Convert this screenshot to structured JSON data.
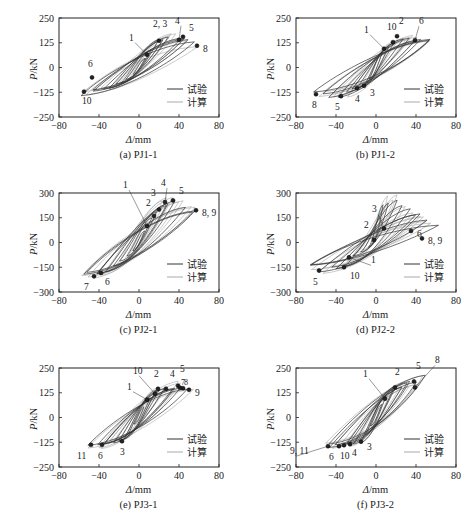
{
  "figure": {
    "x_axis_label": "Δ/mm",
    "y_axis_label": "P/kN",
    "legend": [
      {
        "label": "试验",
        "color": "#333333",
        "role": "test"
      },
      {
        "label": "计算",
        "color": "#aaaaaa",
        "role": "calculation"
      }
    ],
    "colors": {
      "test": "#333333",
      "calc": "#a8a8a8",
      "marker": "#222222",
      "axis": "#222222"
    }
  },
  "chart_data": [
    {
      "type": "line",
      "id": "a",
      "title": "(a) PJ1-1",
      "xlabel": "Δ/mm",
      "ylabel": "P/kN",
      "xlim": [
        -80,
        80
      ],
      "ylim": [
        -250,
        250
      ],
      "xticks": [
        -80,
        -40,
        0,
        40,
        80
      ],
      "yticks": [
        250,
        125,
        0,
        -125,
        -250
      ],
      "legend": [
        "试验",
        "计算"
      ],
      "legend_position": "lower right",
      "grid": false,
      "envelope_pos": [
        [
          0,
          0
        ],
        [
          8,
          65
        ],
        [
          20,
          135
        ],
        [
          33,
          155
        ],
        [
          42,
          150
        ],
        [
          58,
          115
        ]
      ],
      "envelope_neg": [
        [
          0,
          0
        ],
        [
          -10,
          -55
        ],
        [
          -25,
          -95
        ],
        [
          -45,
          -120
        ],
        [
          -55,
          -130
        ]
      ],
      "points": [
        {
          "label": "1",
          "x": 8,
          "y": 65
        },
        {
          "label": "2, 3",
          "x": 20,
          "y": 135
        },
        {
          "label": "4",
          "x": 40,
          "y": 140
        },
        {
          "label": "5",
          "x": 44,
          "y": 155
        },
        {
          "label": "6",
          "x": -47,
          "y": -50
        },
        {
          "label": "8",
          "x": 58,
          "y": 110
        },
        {
          "label": "10",
          "x": -55,
          "y": -122
        }
      ]
    },
    {
      "type": "line",
      "id": "b",
      "title": "(b) PJ1-2",
      "xlabel": "Δ/mm",
      "ylabel": "P/kN",
      "xlim": [
        -80,
        80
      ],
      "ylim": [
        -250,
        250
      ],
      "xticks": [
        -80,
        -40,
        0,
        40,
        80
      ],
      "yticks": [
        250,
        125,
        0,
        -125,
        -250
      ],
      "legend": [
        "试验",
        "计算"
      ],
      "legend_position": "lower right",
      "grid": false,
      "envelope_pos": [
        [
          0,
          0
        ],
        [
          8,
          90
        ],
        [
          18,
          130
        ],
        [
          22,
          160
        ],
        [
          40,
          145
        ],
        [
          58,
          150
        ]
      ],
      "envelope_neg": [
        [
          0,
          0
        ],
        [
          -10,
          -90
        ],
        [
          -18,
          -105
        ],
        [
          -33,
          -145
        ],
        [
          -58,
          -135
        ]
      ],
      "points": [
        {
          "label": "1",
          "x": 8,
          "y": 95
        },
        {
          "label": "10",
          "x": 17,
          "y": 128
        },
        {
          "label": "2",
          "x": 21,
          "y": 158
        },
        {
          "label": "6",
          "x": 39,
          "y": 138
        },
        {
          "label": "3",
          "x": -12,
          "y": -92
        },
        {
          "label": "4",
          "x": -19,
          "y": -105
        },
        {
          "label": "5",
          "x": -35,
          "y": -145
        },
        {
          "label": "8",
          "x": -60,
          "y": -135
        }
      ]
    },
    {
      "type": "line",
      "id": "c",
      "title": "(c) PJ2-1",
      "xlabel": "Δ/mm",
      "ylabel": "P/kN",
      "xlim": [
        -80,
        80
      ],
      "ylim": [
        -300,
        300
      ],
      "xticks": [
        -80,
        -40,
        0,
        40,
        80
      ],
      "yticks": [
        300,
        150,
        0,
        -150,
        -300
      ],
      "legend": [
        "试验",
        "计算"
      ],
      "legend_position": "lower right",
      "grid": false,
      "envelope_pos": [
        [
          0,
          0
        ],
        [
          8,
          100
        ],
        [
          14,
          155
        ],
        [
          18,
          200
        ],
        [
          26,
          245
        ],
        [
          33,
          255
        ],
        [
          56,
          195
        ]
      ],
      "envelope_neg": [
        [
          0,
          0
        ],
        [
          -15,
          -110
        ],
        [
          -30,
          -160
        ],
        [
          -39,
          -185
        ],
        [
          -45,
          -200
        ],
        [
          -58,
          -190
        ]
      ],
      "points": [
        {
          "label": "1",
          "x": 8,
          "y": 100
        },
        {
          "label": "2",
          "x": 15,
          "y": 160
        },
        {
          "label": "3",
          "x": 20,
          "y": 200
        },
        {
          "label": "4",
          "x": 26,
          "y": 245
        },
        {
          "label": "5",
          "x": 34,
          "y": 255
        },
        {
          "label": "8, 9",
          "x": 57,
          "y": 195
        },
        {
          "label": "6",
          "x": -38,
          "y": -185
        },
        {
          "label": "7",
          "x": -45,
          "y": -205
        }
      ]
    },
    {
      "type": "line",
      "id": "d",
      "title": "(d) PJ2-2",
      "xlabel": "Δ/mm",
      "ylabel": "P/kN",
      "xlim": [
        -80,
        80
      ],
      "ylim": [
        -300,
        300
      ],
      "xticks": [
        -80,
        -40,
        0,
        40,
        80
      ],
      "yticks": [
        300,
        150,
        0,
        -150,
        -300
      ],
      "legend": [
        "试验",
        "计算"
      ],
      "legend_position": "lower right",
      "grid": false,
      "envelope_pos": [
        [
          0,
          0
        ],
        [
          -5,
          150
        ],
        [
          8,
          250
        ],
        [
          20,
          270
        ],
        [
          35,
          200
        ],
        [
          58,
          110
        ]
      ],
      "envelope_neg": [
        [
          0,
          0
        ],
        [
          -25,
          -90
        ],
        [
          -31,
          -150
        ],
        [
          -55,
          -170
        ],
        [
          -68,
          -140
        ]
      ],
      "points": [
        {
          "label": "1",
          "x": -27,
          "y": -90
        },
        {
          "label": "2",
          "x": -2,
          "y": 15
        },
        {
          "label": "3",
          "x": 8,
          "y": 85
        },
        {
          "label": "5",
          "x": -57,
          "y": -170
        },
        {
          "label": "6",
          "x": 35,
          "y": 70
        },
        {
          "label": "8, 9",
          "x": 46,
          "y": 25
        },
        {
          "label": "10",
          "x": -32,
          "y": -150
        }
      ]
    },
    {
      "type": "line",
      "id": "e",
      "title": "(e) PJ3-1",
      "xlabel": "Δ/mm",
      "ylabel": "P/kN",
      "xlim": [
        -80,
        80
      ],
      "ylim": [
        -250,
        250
      ],
      "xticks": [
        -80,
        -40,
        0,
        40,
        80
      ],
      "yticks": [
        250,
        125,
        0,
        -125,
        -250
      ],
      "legend": [
        "试验",
        "计算"
      ],
      "legend_position": "lower right",
      "grid": false,
      "envelope_pos": [
        [
          0,
          0
        ],
        [
          8,
          85
        ],
        [
          16,
          125
        ],
        [
          19,
          150
        ],
        [
          27,
          145
        ],
        [
          39,
          165
        ],
        [
          50,
          140
        ]
      ],
      "envelope_neg": [
        [
          0,
          0
        ],
        [
          -17,
          -120
        ],
        [
          -38,
          -140
        ],
        [
          -48,
          -140
        ]
      ],
      "points": [
        {
          "label": "1",
          "x": 8,
          "y": 90
        },
        {
          "label": "10",
          "x": 16,
          "y": 120
        },
        {
          "label": "2",
          "x": 19,
          "y": 145
        },
        {
          "label": "4",
          "x": 27,
          "y": 145
        },
        {
          "label": "5",
          "x": 39,
          "y": 160
        },
        {
          "label": "7",
          "x": 41,
          "y": 150
        },
        {
          "label": "8",
          "x": 44,
          "y": 148
        },
        {
          "label": "9",
          "x": 50,
          "y": 140
        },
        {
          "label": "3",
          "x": -17,
          "y": -120
        },
        {
          "label": "6",
          "x": -37,
          "y": -138
        },
        {
          "label": "11",
          "x": -48,
          "y": -138
        }
      ]
    },
    {
      "type": "line",
      "id": "f",
      "title": "(f) PJ3-2",
      "xlabel": "Δ/mm",
      "ylabel": "P/kN",
      "xlim": [
        -80,
        80
      ],
      "ylim": [
        -250,
        250
      ],
      "xticks": [
        -80,
        -40,
        0,
        40,
        80
      ],
      "yticks": [
        250,
        125,
        0,
        -125,
        -250
      ],
      "legend": [
        "试验",
        "计算"
      ],
      "legend_position": "lower right",
      "grid": false,
      "envelope_pos": [
        [
          0,
          0
        ],
        [
          9,
          95
        ],
        [
          19,
          155
        ],
        [
          38,
          185
        ],
        [
          48,
          200
        ]
      ],
      "envelope_neg": [
        [
          0,
          0
        ],
        [
          -15,
          -120
        ],
        [
          -26,
          -138
        ],
        [
          -33,
          -142
        ],
        [
          -37,
          -145
        ],
        [
          -48,
          -145
        ]
      ],
      "points": [
        {
          "label": "1",
          "x": 9,
          "y": 95
        },
        {
          "label": "2",
          "x": 19,
          "y": 152
        },
        {
          "label": "5",
          "x": 38,
          "y": 182
        },
        {
          "label": "8",
          "x": 39,
          "y": 152
        },
        {
          "label": "3",
          "x": -15,
          "y": -122
        },
        {
          "label": "4",
          "x": -26,
          "y": -135
        },
        {
          "label": "10",
          "x": -32,
          "y": -140
        },
        {
          "label": "6",
          "x": -37,
          "y": -145
        },
        {
          "label": "9, 11",
          "x": -48,
          "y": -145
        }
      ]
    }
  ],
  "layout": {
    "panels": [
      {
        "id": "a",
        "left": 0,
        "top": 0
      },
      {
        "id": "b",
        "left": 237,
        "top": 0
      },
      {
        "id": "c",
        "left": 0,
        "top": 175
      },
      {
        "id": "d",
        "left": 237,
        "top": 175
      },
      {
        "id": "e",
        "left": 0,
        "top": 350
      },
      {
        "id": "f",
        "left": 237,
        "top": 350
      }
    ]
  },
  "label_offsets": {
    "a": {
      "1": [
        -18,
        -14
      ],
      "2, 3": [
        -6,
        -14
      ],
      "4": [
        -4,
        -16
      ],
      "5": [
        6,
        -6
      ],
      "6": [
        -4,
        -10
      ],
      "8": [
        6,
        6
      ],
      "10": [
        -2,
        12
      ]
    },
    "b": {
      "1": [
        -20,
        -16
      ],
      "10": [
        -6,
        -12
      ],
      "2": [
        2,
        -12
      ],
      "6": [
        4,
        -16
      ],
      "3": [
        6,
        10
      ],
      "4": [
        -2,
        14
      ],
      "5": [
        -6,
        14
      ],
      "8": [
        -4,
        14
      ]
    },
    "c": {
      "1": [
        -24,
        -38
      ],
      "2": [
        -8,
        -10
      ],
      "3": [
        -8,
        -14
      ],
      "4": [
        -4,
        -16
      ],
      "5": [
        6,
        -6
      ],
      "8, 9": [
        6,
        6
      ],
      "6": [
        4,
        12
      ],
      "7": [
        -10,
        14
      ]
    },
    "d": {
      "1": [
        22,
        6
      ],
      "2": [
        -10,
        -12
      ],
      "3": [
        -12,
        -16
      ],
      "5": [
        -6,
        14
      ],
      "6": [
        6,
        6
      ],
      "8, 9": [
        6,
        6
      ],
      "10": [
        6,
        12
      ]
    },
    "e": {
      "1": [
        -20,
        -10
      ],
      "10": [
        -22,
        -20
      ],
      "2": [
        -4,
        -12
      ],
      "4": [
        4,
        -12
      ],
      "5": [
        2,
        -14
      ],
      "7": [
        0,
        0
      ],
      "8": [
        0,
        0
      ],
      "9": [
        6,
        6
      ],
      "3": [
        -2,
        14
      ],
      "6": [
        -4,
        14
      ],
      "11": [
        -14,
        14
      ]
    },
    "f": {
      "1": [
        -22,
        -22
      ],
      "2": [
        0,
        -12
      ],
      "5": [
        2,
        -12
      ],
      "8": [
        20,
        -24
      ],
      "3": [
        6,
        8
      ],
      "4": [
        2,
        12
      ],
      "10": [
        -4,
        14
      ],
      "6": [
        -10,
        14
      ],
      "9, 11": [
        -38,
        8
      ]
    }
  }
}
